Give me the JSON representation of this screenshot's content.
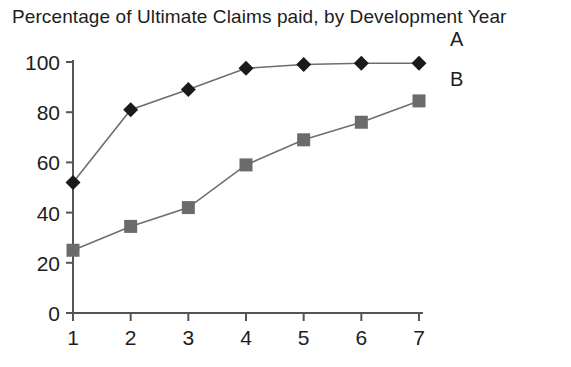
{
  "chart_data": {
    "type": "line",
    "title": "Percentage of Ultimate Claims paid, by Development Year",
    "xlabel": "",
    "ylabel": "",
    "x": [
      1,
      2,
      3,
      4,
      5,
      6,
      7
    ],
    "categories": [
      "1",
      "2",
      "3",
      "4",
      "5",
      "6",
      "7"
    ],
    "xlim": [
      1,
      7
    ],
    "ylim": [
      0,
      100
    ],
    "xticks": [
      "1",
      "2",
      "3",
      "4",
      "5",
      "6",
      "7"
    ],
    "yticks": [
      "0",
      "20",
      "40",
      "60",
      "80",
      "100"
    ],
    "grid": false,
    "legend_position": "right-inline",
    "series": [
      {
        "name": "A",
        "marker": "diamond",
        "color": "#1a1a1a",
        "line_color": "#6e6e6e",
        "values": [
          52,
          81,
          89,
          97.5,
          99,
          99.5,
          99.5
        ]
      },
      {
        "name": "B",
        "marker": "square",
        "color": "#6b6b6b",
        "line_color": "#6e6e6e",
        "values": [
          25,
          34.5,
          42,
          59,
          69,
          76,
          84.5
        ]
      }
    ]
  },
  "axis": {
    "color": "#555555"
  }
}
